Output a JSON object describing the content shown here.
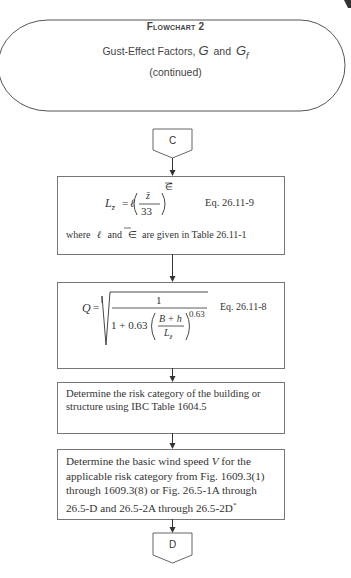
{
  "header": {
    "flowchart_label": "Flowchart 2",
    "title_text": "Gust-Effect Factors,",
    "symbol_g": "G",
    "and_text": "and",
    "symbol_gf": "G",
    "symbol_gf_sub": "f",
    "continued": "(continued)"
  },
  "connectors": {
    "top": "C",
    "bottom": "D"
  },
  "boxes": {
    "lz": {
      "lhs": "L",
      "lhs_sub": "z̄",
      "equals": "=",
      "ell": "ℓ",
      "frac_num": "z̄",
      "frac_den": "33",
      "exponent": "∈̄",
      "eq_ref": "Eq. 26.11-9",
      "note_where": "where",
      "note_ell": "ℓ",
      "note_and": "and",
      "note_eps": "∈̄",
      "note_rest": "are given in Table 26.11-1"
    },
    "q": {
      "lhs": "Q",
      "equals": "=",
      "numerator": "1",
      "den_prefix": "1 + 0.63",
      "inner_num": "B + h",
      "inner_den": "L",
      "inner_den_sub": "z̄",
      "exponent": "0.63",
      "eq_ref": "Eq. 26.11-8"
    },
    "risk": {
      "line1": "Determine the risk category of the building or",
      "line2": "structure using IBC Table 1604.5"
    },
    "wind": {
      "line1_a": "Determine the basic wind speed ",
      "line1_v": "V",
      "line1_b": " for the",
      "line2": "applicable risk category from Fig. 1609.3(1)",
      "line3": "through 1609.3(8) or Fig. 26.5-1A through",
      "line4_a": "26.5-D and 26.5-2A through 26.5-2D",
      "line4_sup": "*"
    }
  }
}
